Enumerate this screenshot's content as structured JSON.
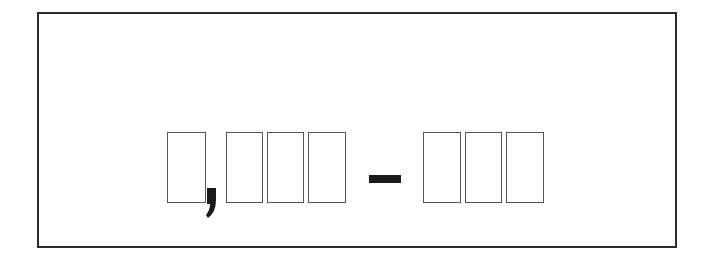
{
  "display": {
    "text": "□,□□□ – □□□",
    "description": "Placeholder number range with missing-glyph boxes",
    "groups": [
      {
        "name": "thousands",
        "glyph_count": 1
      },
      {
        "name": "hundreds",
        "glyph_count": 3
      },
      {
        "name": "range_end",
        "glyph_count": 3
      }
    ],
    "separator_comma": ",",
    "separator_dash": "–"
  },
  "colors": {
    "border": "#2b2b2b",
    "glyph_outline": "#555555",
    "punctuation": "#1a1a1a",
    "background": "#ffffff"
  }
}
